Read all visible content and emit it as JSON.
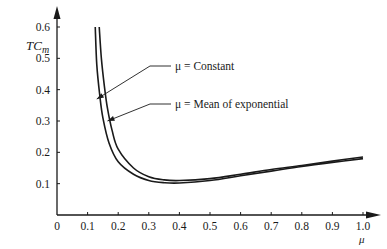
{
  "chart_data": {
    "type": "line",
    "title": "",
    "xlabel": "μ",
    "ylabel": "TC_m",
    "xlim": [
      0,
      1.0
    ],
    "ylim": [
      0,
      0.6
    ],
    "x_ticks": [
      "0",
      "0.1",
      "0.2",
      "0.3",
      "0.4",
      "0.5",
      "0.6",
      "0.7",
      "0.8",
      "0.9",
      "1.0"
    ],
    "y_ticks": [
      "0.1",
      "0.2",
      "0.3",
      "0.4",
      "0.5",
      "0.6"
    ],
    "grid": false,
    "legend_position": "inline annotations with arrows",
    "series": [
      {
        "name": "μ = Constant",
        "x": [
          0.125,
          0.13,
          0.14,
          0.15,
          0.17,
          0.2,
          0.25,
          0.3,
          0.35,
          0.4,
          0.5,
          0.6,
          0.7,
          0.8,
          0.9,
          1.0
        ],
        "y": [
          0.6,
          0.48,
          0.38,
          0.31,
          0.23,
          0.17,
          0.13,
          0.11,
          0.103,
          0.102,
          0.11,
          0.125,
          0.14,
          0.155,
          0.168,
          0.18
        ]
      },
      {
        "name": "μ = Mean of exponential",
        "x": [
          0.138,
          0.145,
          0.155,
          0.165,
          0.18,
          0.2,
          0.25,
          0.3,
          0.35,
          0.4,
          0.5,
          0.6,
          0.7,
          0.8,
          0.9,
          1.0
        ],
        "y": [
          0.6,
          0.5,
          0.41,
          0.34,
          0.27,
          0.21,
          0.15,
          0.122,
          0.112,
          0.11,
          0.116,
          0.13,
          0.145,
          0.158,
          0.172,
          0.185
        ]
      }
    ],
    "annotations": [
      {
        "text": "μ = Constant",
        "arrow_to": [
          0.13,
          0.37
        ]
      },
      {
        "text": "μ = Mean of exponential",
        "arrow_to": [
          0.165,
          0.3
        ]
      }
    ]
  },
  "labels": {
    "y_axis": "TC",
    "y_axis_sub": "m",
    "x_axis": "μ",
    "annotation_constant": "μ = Constant",
    "annotation_exponential": "μ = Mean of exponential"
  }
}
